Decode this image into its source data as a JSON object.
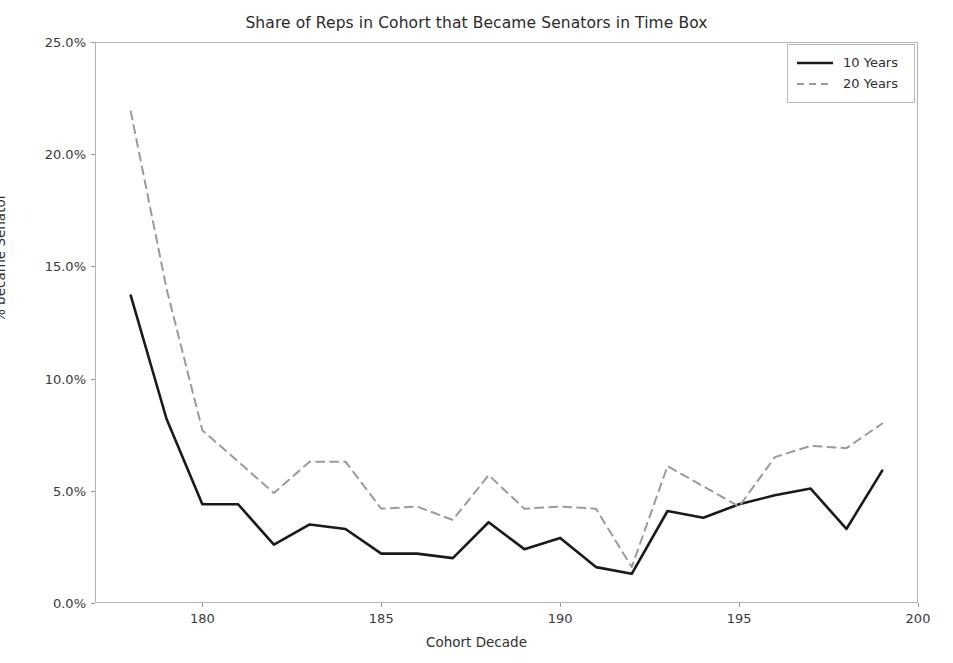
{
  "chart_data": {
    "type": "line",
    "title": "Share of Reps in Cohort that Became Senators in Time Box",
    "xlabel": "Cohort Decade",
    "ylabel": "% became Senator",
    "xlim": [
      177.0,
      200.0
    ],
    "ylim": [
      0.0,
      25.0
    ],
    "grid": false,
    "legend_position": "upper right",
    "xticks": [
      180,
      185,
      190,
      195,
      200
    ],
    "xtick_labels": [
      "180",
      "185",
      "190",
      "195",
      "200"
    ],
    "yticks": [
      0.0,
      5.0,
      10.0,
      15.0,
      20.0,
      25.0
    ],
    "ytick_labels": [
      "0.0%",
      "5.0%",
      "10.0%",
      "15.0%",
      "20.0%",
      "25.0%"
    ],
    "x": [
      178,
      179,
      180,
      181,
      182,
      183,
      184,
      185,
      186,
      187,
      188,
      189,
      190,
      191,
      192,
      193,
      194,
      195,
      196,
      197,
      198,
      199
    ],
    "series": [
      {
        "name": "10 Years",
        "style": "solid",
        "color": "#1a1a1a",
        "values": [
          13.7,
          8.2,
          4.4,
          4.4,
          2.6,
          3.5,
          3.3,
          2.2,
          2.2,
          2.0,
          3.6,
          2.4,
          2.9,
          1.6,
          1.3,
          4.1,
          3.8,
          4.4,
          4.8,
          5.1,
          3.3,
          5.9
        ]
      },
      {
        "name": "20 Years",
        "style": "dashed",
        "color": "#9a9a9a",
        "values": [
          21.9,
          14.0,
          7.7,
          6.3,
          4.9,
          6.3,
          6.3,
          4.2,
          4.3,
          3.7,
          5.7,
          4.2,
          4.3,
          4.2,
          1.6,
          6.1,
          5.2,
          4.3,
          6.5,
          7.0,
          6.9,
          8.0
        ]
      }
    ]
  },
  "legend": {
    "items": [
      {
        "label": "10 Years"
      },
      {
        "label": "20 Years"
      }
    ]
  }
}
